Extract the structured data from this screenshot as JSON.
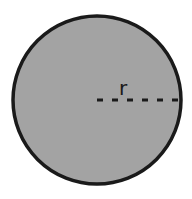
{
  "diagram": {
    "circle": {
      "cx": 97,
      "cy": 100,
      "r": 84,
      "fill": "#a3a3a3",
      "stroke": "#1a1a1a",
      "stroke_width": 3.5
    },
    "radius_line": {
      "x1": 97,
      "y1": 100,
      "x2": 178,
      "y2": 100,
      "style": "dashed",
      "dash": "6 9",
      "color": "#1a1a1a"
    },
    "label": {
      "text": "r",
      "x": 119,
      "y": 95
    }
  }
}
